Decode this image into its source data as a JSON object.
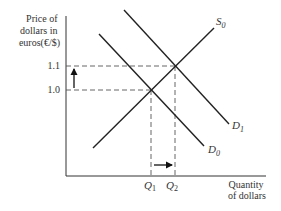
{
  "diagram": {
    "type": "supply-demand",
    "y_axis_label_lines": [
      "Price of",
      "dollars in",
      "euros(€/$)"
    ],
    "x_axis_label_lines": [
      "Quantity",
      "of dollars"
    ],
    "y_ticks": [
      {
        "label": "1.1",
        "y": 66
      },
      {
        "label": "1.0",
        "y": 90
      }
    ],
    "x_ticks": [
      {
        "label": "Q",
        "sub": "1",
        "x": 151
      },
      {
        "label": "Q",
        "sub": "2",
        "x": 175
      }
    ],
    "curves": [
      {
        "name": "S",
        "sub": "0",
        "kind": "supply",
        "x1": 93,
        "y1": 148,
        "x2": 214,
        "y2": 28
      },
      {
        "name": "D",
        "sub": "0",
        "kind": "demand",
        "x1": 99,
        "y1": 34,
        "x2": 204,
        "y2": 146
      },
      {
        "name": "D",
        "sub": "1",
        "kind": "demand",
        "x1": 124,
        "y1": 10,
        "x2": 229,
        "y2": 124
      }
    ],
    "equilibria": [
      {
        "label": "initial",
        "price": "1.0",
        "quantity": "Q1",
        "x": 151,
        "y": 90
      },
      {
        "label": "new",
        "price": "1.1",
        "quantity": "Q2",
        "x": 175,
        "y": 66
      }
    ],
    "shift_arrows": [
      {
        "direction": "up",
        "meaning": "price rises from 1.0 to 1.1"
      },
      {
        "direction": "right",
        "meaning": "quantity rises from Q1 to Q2"
      }
    ],
    "colors": {
      "line": "#222222",
      "text": "#333333",
      "background": "#ffffff"
    }
  }
}
